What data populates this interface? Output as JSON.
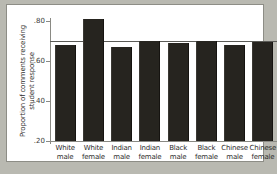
{
  "chart_data": {
    "type": "bar",
    "title": "",
    "xlabel": "",
    "ylabel_line1": "Proportion of comments receiving",
    "ylabel_line2": "student response",
    "ylim": [
      0.2,
      0.8
    ],
    "ytick_values": [
      0.8,
      0.6,
      0.4,
      0.2
    ],
    "ytick_labels": [
      ".80",
      ".60",
      ".40",
      ".20"
    ],
    "grid": false,
    "legend": "none",
    "reference_line": 0.7,
    "bar_color": "#26241f",
    "categories": [
      {
        "line1": "White",
        "line2": "male"
      },
      {
        "line1": "White",
        "line2": "female"
      },
      {
        "line1": "Indian",
        "line2": "male"
      },
      {
        "line1": "Indian",
        "line2": "female"
      },
      {
        "line1": "Black",
        "line2": "male"
      },
      {
        "line1": "Black",
        "line2": "female"
      },
      {
        "line1": "Chinese",
        "line2": "male"
      },
      {
        "line1": "Chinese",
        "line2": "female"
      }
    ],
    "values": [
      0.68,
      0.81,
      0.67,
      0.7,
      0.69,
      0.7,
      0.68,
      0.695
    ]
  }
}
